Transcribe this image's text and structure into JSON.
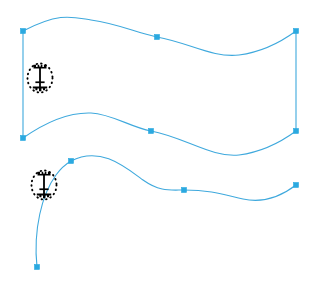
{
  "app": {
    "title": "Vector Path Editor Canvas",
    "background_color": "#ffffff"
  },
  "colors": {
    "path_stroke": "#3fa9dd",
    "anchor_fill": "#2ba9e0",
    "anchor_stroke": "#2ba9e0",
    "cursor_ink": "#000000",
    "canvas_background": "#ffffff"
  },
  "canvas": {
    "width": 315,
    "height": 286,
    "stroke_width": 1.1,
    "anchor_size": 5
  },
  "paths": [
    {
      "name": "upper-ribbon-path",
      "kind": "closed-ribbon",
      "d": "M 23 31 C 60 12 72 17 91 20 C 120 24 136 33 157 37 C 190 43 212 58 239 55 C 262 52 281 42 296 31 L 296 131 C 281 142 262 152 239 155 C 212 158 184 137 151 131 C 130 127 112 114 91 113 C 66 112 43 124 23 138 Z",
      "fill": "none"
    },
    {
      "name": "lower-open-path",
      "kind": "open-curve",
      "d": "M 37 267 C 33 230 42 194 56 175 C 61 168 66 164 71 161 C 100 146 124 166 143 180 C 160 192 170 190 184 190 C 212 190 225 195 243 199 C 266 204 283 195 296 185",
      "fill": "none"
    }
  ],
  "anchors": [
    {
      "name": "anchor-upper-left-top",
      "x": 23,
      "y": 31,
      "type": "corner"
    },
    {
      "name": "anchor-upper-mid-top",
      "x": 157,
      "y": 37,
      "type": "smooth"
    },
    {
      "name": "anchor-upper-right-top",
      "x": 296,
      "y": 31,
      "type": "corner"
    },
    {
      "name": "anchor-upper-right-bottom",
      "x": 296,
      "y": 131,
      "type": "corner"
    },
    {
      "name": "anchor-upper-mid-bottom",
      "x": 151,
      "y": 131,
      "type": "smooth"
    },
    {
      "name": "anchor-upper-left-bottom",
      "x": 23,
      "y": 138,
      "type": "corner"
    },
    {
      "name": "anchor-lower-start",
      "x": 37,
      "y": 267,
      "type": "corner"
    },
    {
      "name": "anchor-lower-upper-left",
      "x": 71,
      "y": 161,
      "type": "smooth"
    },
    {
      "name": "anchor-lower-mid",
      "x": 184,
      "y": 190,
      "type": "smooth"
    },
    {
      "name": "anchor-lower-right-end",
      "x": 296,
      "y": 185,
      "type": "corner"
    }
  ],
  "cursors": [
    {
      "name": "text-ibeam-cursor-upper",
      "icon": "text-ibeam-cursor-icon",
      "x": 40,
      "y": 78,
      "label": "I-beam text cursor with dotted selection ellipse"
    },
    {
      "name": "text-ibeam-cursor-lower",
      "icon": "text-ibeam-cursor-icon",
      "x": 44,
      "y": 185,
      "label": "I-beam text cursor with dotted selection ellipse"
    }
  ]
}
